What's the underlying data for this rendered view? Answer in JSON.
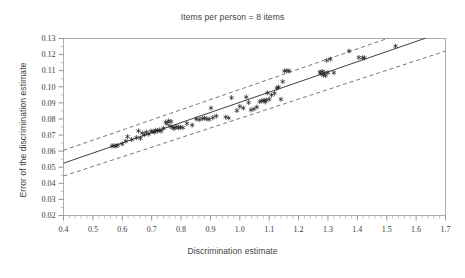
{
  "chart_data": {
    "type": "scatter",
    "title": "Items per person = 8 items",
    "xlabel": "Discrimination estimate",
    "ylabel": "Error of the discrimination estimate",
    "xlim": [
      0.4,
      1.7
    ],
    "ylim": [
      0.02,
      0.13
    ],
    "grid": false,
    "legend": null,
    "x_ticks": [
      "0.4",
      "0.5",
      "0.6",
      "0.7",
      "0.8",
      "0.9",
      "1.0",
      "1.1",
      "1.2",
      "1.3",
      "1.4",
      "1.5",
      "1.6",
      "1.7"
    ],
    "x_tick_values": [
      0.4,
      0.5,
      0.6,
      0.7,
      0.8,
      0.9,
      1.0,
      1.1,
      1.2,
      1.3,
      1.4,
      1.5,
      1.6,
      1.7
    ],
    "x_minor_step": 0.02,
    "y_ticks": [
      "0.02",
      "0.03",
      "0.04",
      "0.05",
      "0.06",
      "0.07",
      "0.08",
      "0.09",
      "0.10",
      "0.11",
      "0.12",
      "0.13"
    ],
    "y_tick_values": [
      0.02,
      0.03,
      0.04,
      0.05,
      0.06,
      0.07,
      0.08,
      0.09,
      0.1,
      0.11,
      0.12,
      0.13
    ],
    "y_minor_step": 0.005,
    "marker_symbol": "asterisk",
    "series": [
      {
        "name": "observations",
        "points": [
          [
            0.565,
            0.0632
          ],
          [
            0.572,
            0.0634
          ],
          [
            0.578,
            0.0631
          ],
          [
            0.585,
            0.0636
          ],
          [
            0.6,
            0.0645
          ],
          [
            0.612,
            0.0662
          ],
          [
            0.618,
            0.069
          ],
          [
            0.632,
            0.0672
          ],
          [
            0.648,
            0.0684
          ],
          [
            0.655,
            0.0726
          ],
          [
            0.662,
            0.068
          ],
          [
            0.668,
            0.0712
          ],
          [
            0.675,
            0.0702
          ],
          [
            0.682,
            0.0718
          ],
          [
            0.69,
            0.0706
          ],
          [
            0.698,
            0.0724
          ],
          [
            0.705,
            0.0722
          ],
          [
            0.71,
            0.0718
          ],
          [
            0.714,
            0.073
          ],
          [
            0.72,
            0.0726
          ],
          [
            0.726,
            0.0732
          ],
          [
            0.732,
            0.0724
          ],
          [
            0.74,
            0.0742
          ],
          [
            0.748,
            0.078
          ],
          [
            0.752,
            0.0772
          ],
          [
            0.758,
            0.0788
          ],
          [
            0.762,
            0.0756
          ],
          [
            0.766,
            0.0784
          ],
          [
            0.77,
            0.0748
          ],
          [
            0.775,
            0.0742
          ],
          [
            0.78,
            0.0746
          ],
          [
            0.786,
            0.0752
          ],
          [
            0.792,
            0.0744
          ],
          [
            0.798,
            0.075
          ],
          [
            0.806,
            0.0746
          ],
          [
            0.82,
            0.0772
          ],
          [
            0.838,
            0.0762
          ],
          [
            0.852,
            0.08
          ],
          [
            0.862,
            0.0796
          ],
          [
            0.872,
            0.0802
          ],
          [
            0.88,
            0.0806
          ],
          [
            0.888,
            0.08
          ],
          [
            0.896,
            0.0798
          ],
          [
            0.902,
            0.0868
          ],
          [
            0.908,
            0.0808
          ],
          [
            0.92,
            0.0818
          ],
          [
            0.952,
            0.0812
          ],
          [
            0.962,
            0.0806
          ],
          [
            0.972,
            0.0932
          ],
          [
            0.99,
            0.0852
          ],
          [
            1.0,
            0.0878
          ],
          [
            1.012,
            0.0868
          ],
          [
            1.022,
            0.0936
          ],
          [
            1.03,
            0.0902
          ],
          [
            1.038,
            0.0856
          ],
          [
            1.048,
            0.0862
          ],
          [
            1.058,
            0.0874
          ],
          [
            1.068,
            0.0908
          ],
          [
            1.075,
            0.0912
          ],
          [
            1.082,
            0.0916
          ],
          [
            1.086,
            0.0906
          ],
          [
            1.09,
            0.0918
          ],
          [
            1.094,
            0.0962
          ],
          [
            1.1,
            0.0922
          ],
          [
            1.108,
            0.0948
          ],
          [
            1.118,
            0.096
          ],
          [
            1.126,
            0.0992
          ],
          [
            1.132,
            0.0998
          ],
          [
            1.14,
            0.0922
          ],
          [
            1.146,
            0.1032
          ],
          [
            1.152,
            0.1098
          ],
          [
            1.16,
            0.11
          ],
          [
            1.168,
            0.1098
          ],
          [
            1.272,
            0.109
          ],
          [
            1.276,
            0.1082
          ],
          [
            1.28,
            0.1096
          ],
          [
            1.284,
            0.1072
          ],
          [
            1.288,
            0.1088
          ],
          [
            1.292,
            0.107
          ],
          [
            1.296,
            0.1164
          ],
          [
            1.3,
            0.1088
          ],
          [
            1.308,
            0.1172
          ],
          [
            1.32,
            0.1088
          ],
          [
            1.372,
            0.1222
          ],
          [
            1.405,
            0.1182
          ],
          [
            1.418,
            0.118
          ],
          [
            1.424,
            0.118
          ],
          [
            1.53,
            0.1252
          ]
        ]
      }
    ],
    "fit_line": {
      "name": "regression-line",
      "x": [
        0.4,
        1.632
      ],
      "y": [
        0.0525,
        0.1302
      ]
    },
    "confidence_bands": [
      {
        "name": "upper-band",
        "x": [
          0.4,
          1.505
        ],
        "y": [
          0.0605,
          0.1302
        ]
      },
      {
        "name": "lower-band",
        "x": [
          0.4,
          1.7
        ],
        "y": [
          0.0445,
          0.1222
        ]
      }
    ]
  }
}
